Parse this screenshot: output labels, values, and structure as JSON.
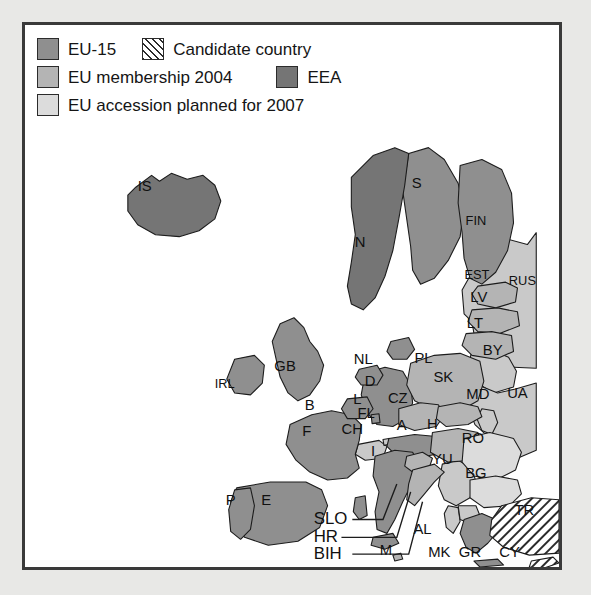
{
  "figure": {
    "frame_color": "#3a3a3a",
    "background_color": "#ffffff",
    "page_background_color": "#e8e8e6"
  },
  "legend": {
    "rows": [
      {
        "entries": [
          {
            "label": "EU-15",
            "swatch": "eu15-swatch",
            "color": "#8f8f8f",
            "pattern": "solid"
          },
          {
            "label": "Candidate country",
            "swatch": "candidate-swatch",
            "color": "#2b2b2b",
            "pattern": "diagonal-hatch"
          }
        ]
      },
      {
        "entries": [
          {
            "label": "EU membership 2004",
            "swatch": "eu2004-swatch",
            "color": "#b4b4b4",
            "pattern": "solid"
          },
          {
            "label": "EEA",
            "swatch": "eea-swatch",
            "color": "#757575",
            "pattern": "solid"
          }
        ]
      },
      {
        "entries": [
          {
            "label": "EU accession planned for 2007",
            "swatch": "eu2007-swatch",
            "color": "#dcdcdc",
            "pattern": "solid"
          }
        ]
      }
    ]
  },
  "map": {
    "categories": {
      "eu15": "EU-15",
      "eu2004": "EU membership 2004",
      "eu2007": "EU accession planned for 2007",
      "eea": "EEA",
      "candidate": "Candidate country",
      "other": "Non-member"
    },
    "labels": [
      {
        "code": "IS",
        "name": "Iceland",
        "category": "eea",
        "x": 143,
        "y": 186
      },
      {
        "code": "S",
        "name": "Sweden",
        "category": "eu15",
        "x": 418,
        "y": 183
      },
      {
        "code": "FIN",
        "name": "Finland",
        "category": "eu15",
        "x": 478,
        "y": 221
      },
      {
        "code": "N",
        "name": "Norway",
        "category": "eea",
        "x": 361,
        "y": 243
      },
      {
        "code": "EST",
        "name": "Estonia",
        "category": "eu2004",
        "x": 479,
        "y": 275
      },
      {
        "code": "LV",
        "name": "Latvia",
        "category": "eu2004",
        "x": 481,
        "y": 298
      },
      {
        "code": "LT",
        "name": "Lithuania",
        "category": "eu2004",
        "x": 477,
        "y": 324
      },
      {
        "code": "RUS",
        "name": "Russia",
        "category": "other",
        "x": 525,
        "y": 281
      },
      {
        "code": "BY",
        "name": "Belarus",
        "category": "other",
        "x": 495,
        "y": 352
      },
      {
        "code": "UA",
        "name": "Ukraine",
        "category": "other",
        "x": 520,
        "y": 395
      },
      {
        "code": "MD",
        "name": "Moldova",
        "category": "other",
        "x": 480,
        "y": 396
      },
      {
        "code": "GB",
        "name": "United Kingdom",
        "category": "eu15",
        "x": 285,
        "y": 368
      },
      {
        "code": "IRL",
        "name": "Ireland",
        "category": "eu15",
        "x": 224,
        "y": 386
      },
      {
        "code": "NL",
        "name": "Netherlands",
        "category": "eu15",
        "x": 364,
        "y": 361
      },
      {
        "code": "D",
        "name": "Germany",
        "category": "eu15",
        "x": 371,
        "y": 383
      },
      {
        "code": "L",
        "name": "Luxembourg",
        "category": "eu15",
        "x": 358,
        "y": 401
      },
      {
        "code": "B",
        "name": "Belgium",
        "category": "eu15",
        "x": 310,
        "y": 407
      },
      {
        "code": "F",
        "name": "France",
        "category": "eu15",
        "x": 307,
        "y": 434
      },
      {
        "code": "FL",
        "name": "Liechtenstein",
        "category": "other",
        "x": 367,
        "y": 415
      },
      {
        "code": "CH",
        "name": "Switzerland",
        "category": "other",
        "x": 353,
        "y": 432
      },
      {
        "code": "A",
        "name": "Austria",
        "category": "eu15",
        "x": 403,
        "y": 428
      },
      {
        "code": "CZ",
        "name": "Czech Republic",
        "category": "eu2004",
        "x": 399,
        "y": 400
      },
      {
        "code": "PL",
        "name": "Poland",
        "category": "eu2004",
        "x": 425,
        "y": 360
      },
      {
        "code": "SK",
        "name": "Slovakia",
        "category": "eu2004",
        "x": 445,
        "y": 379
      },
      {
        "code": "H",
        "name": "Hungary",
        "category": "eu2004",
        "x": 434,
        "y": 427
      },
      {
        "code": "RO",
        "name": "Romania",
        "category": "eu2007",
        "x": 475,
        "y": 441
      },
      {
        "code": "BG",
        "name": "Bulgaria",
        "category": "eu2007",
        "x": 478,
        "y": 476
      },
      {
        "code": "YU",
        "name": "Yugoslavia",
        "category": "other",
        "x": 444,
        "y": 462
      },
      {
        "code": "I",
        "name": "Italy",
        "category": "eu15",
        "x": 374,
        "y": 454
      },
      {
        "code": "P",
        "name": "Portugal",
        "category": "eu15",
        "x": 230,
        "y": 503
      },
      {
        "code": "E",
        "name": "Spain",
        "category": "eu15",
        "x": 266,
        "y": 503
      },
      {
        "code": "GR",
        "name": "Greece",
        "category": "eu15",
        "x": 472,
        "y": 556
      },
      {
        "code": "MK",
        "name": "Macedonia",
        "category": "other",
        "x": 441,
        "y": 556
      },
      {
        "code": "AL",
        "name": "Albania",
        "category": "other",
        "x": 424,
        "y": 533
      },
      {
        "code": "TR",
        "name": "Turkey",
        "category": "candidate",
        "x": 527,
        "y": 513
      },
      {
        "code": "CY",
        "name": "Cyprus",
        "category": "candidate",
        "x": 512,
        "y": 556
      },
      {
        "code": "M",
        "name": "Malta",
        "category": "other",
        "x": 387,
        "y": 554
      }
    ],
    "callouts": [
      {
        "code": "SLO",
        "name": "Slovenia",
        "x": 314,
        "y": 522,
        "line_to_x": 398,
        "line_to_y": 486
      },
      {
        "code": "HR",
        "name": "Croatia",
        "x": 314,
        "y": 540,
        "line_to_x": 412,
        "line_to_y": 494
      },
      {
        "code": "BIH",
        "name": "Bosnia and Herzegovina",
        "x": 314,
        "y": 557,
        "line_to_x": 424,
        "line_to_y": 504
      }
    ]
  }
}
